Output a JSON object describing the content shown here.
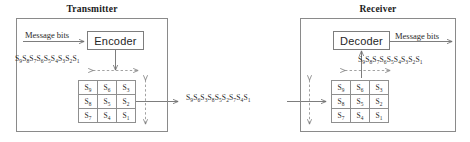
{
  "figure": {
    "type": "block-interleaver-diagram",
    "line_color": "#6e6e6e",
    "box_border_color": "#8a8a8a",
    "text_color": "#2a2a2a",
    "background": "#ffffff"
  },
  "transmitter": {
    "title": "Transmitter",
    "input_label": "Message bits",
    "coder_label": "Encoder",
    "sequence_label": "S9S8S7S6S5S4S3S2S1",
    "sequence_tokens": [
      "S9",
      "S8",
      "S7",
      "S6",
      "S5",
      "S4",
      "S3",
      "S2",
      "S1"
    ],
    "matrix": {
      "rows": 3,
      "cols": 3,
      "cells": [
        [
          "S9",
          "S6",
          "S3"
        ],
        [
          "S8",
          "S5",
          "S2"
        ],
        [
          "S7",
          "S4",
          "S1"
        ]
      ],
      "write_direction": "row-wise",
      "read_direction": "column-wise"
    }
  },
  "channel": {
    "sequence_label": "S9S6S3S8S5S2S7S4S1",
    "sequence_tokens": [
      "S9",
      "S6",
      "S3",
      "S8",
      "S5",
      "S2",
      "S7",
      "S4",
      "S1"
    ]
  },
  "receiver": {
    "title": "Receiver",
    "output_label": "Message bits",
    "coder_label": "Decoder",
    "sequence_label": "S9S8S7S6S5S4S3S2S1",
    "sequence_tokens": [
      "S9",
      "S8",
      "S7",
      "S6",
      "S5",
      "S4",
      "S3",
      "S2",
      "S1"
    ],
    "matrix": {
      "rows": 3,
      "cols": 3,
      "cells": [
        [
          "S9",
          "S6",
          "S3"
        ],
        [
          "S8",
          "S5",
          "S2"
        ],
        [
          "S7",
          "S4",
          "S1"
        ]
      ],
      "write_direction": "column-wise",
      "read_direction": "row-wise"
    }
  }
}
